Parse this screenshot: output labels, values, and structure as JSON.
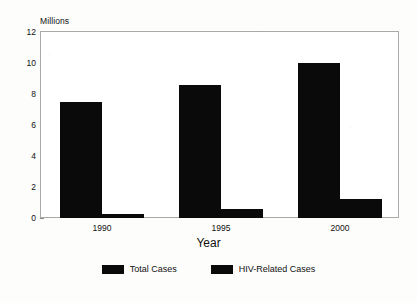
{
  "chart_data": {
    "type": "bar",
    "title": "",
    "subtitle": "",
    "xlabel": "Year",
    "ylabel": "Millions",
    "categories": [
      "1990",
      "1995",
      "2000"
    ],
    "series": [
      {
        "name": "Total Cases",
        "values": [
          7.5,
          8.6,
          10.0
        ],
        "color": "#0a0a0a"
      },
      {
        "name": "HIV-Related Cases",
        "values": [
          0.25,
          0.55,
          1.2
        ],
        "color": "#0a0a0a"
      }
    ],
    "ylim": [
      0,
      12
    ],
    "yticks": [
      0,
      2,
      4,
      6,
      8,
      10,
      12
    ],
    "ytick_labels": [
      "0",
      "2",
      "4",
      "6",
      "8",
      "10",
      "12"
    ],
    "grid": false,
    "legend_position": "bottom",
    "frame": true
  },
  "axes": {
    "unit_label": "Millions",
    "x_title": "Year"
  },
  "legend": {
    "items": [
      {
        "label": "Total Cases",
        "swatch": "legend-swatch-total-cases"
      },
      {
        "label": "HIV-Related Cases",
        "swatch": "legend-swatch-hiv-related-cases"
      }
    ]
  }
}
